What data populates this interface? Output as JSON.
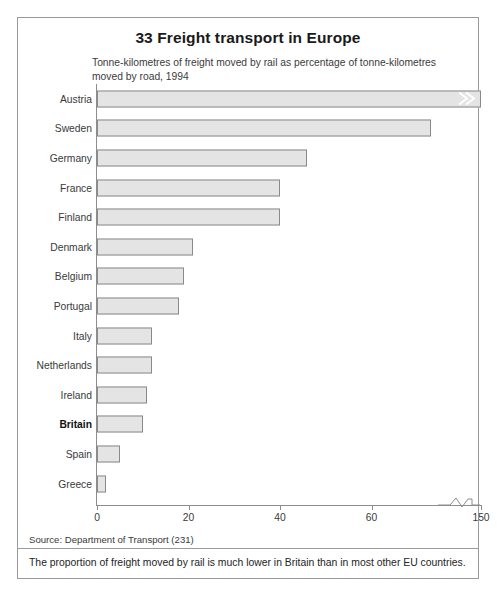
{
  "figure": {
    "title": "33 Freight transport in Europe",
    "subtitle": "Tonne-kilometres of freight moved by rail as percentage of tonne-kilometres moved by road, 1994",
    "source": "Source: Department of Transport (231)",
    "footnote": "The proportion of freight moved by rail is much lower in Britain than in most other EU countries.",
    "break_marker_icon": "double-chevron-break-icon",
    "axis_break_icon": "axis-zigzag-break-icon",
    "colors": {
      "bar_fill": "#e4e4e4",
      "bar_border": "#8a8a8a",
      "axis": "#8d8d8d",
      "frame": "#9a9a9a",
      "text": "#3a3a3a",
      "highlight_text": "#111111"
    }
  },
  "chart_data": {
    "type": "bar",
    "orientation": "horizontal",
    "title": "33 Freight transport in Europe",
    "subtitle": "Tonne-kilometres of freight moved by rail as percentage of tonne-kilometres moved by road, 1994",
    "xlabel": "",
    "ylabel": "",
    "xlim": [
      0,
      150
    ],
    "grid": false,
    "axis_broken": true,
    "axis_break_between": [
      70,
      150
    ],
    "tick_values": [
      0,
      20,
      40,
      60,
      150
    ],
    "tick_labels": [
      "0",
      "20",
      "40",
      "60",
      "150"
    ],
    "highlight_category": "Britain",
    "categories": [
      "Austria",
      "Sweden",
      "Germany",
      "France",
      "Finland",
      "Denmark",
      "Belgium",
      "Portugal",
      "Italy",
      "Netherlands",
      "Ireland",
      "Britain",
      "Spain",
      "Greece"
    ],
    "values": [
      150,
      73,
      46,
      40,
      40,
      21,
      19,
      18,
      12,
      12,
      11,
      10,
      5,
      2
    ],
    "bars": [
      {
        "category": "Austria",
        "value": 150,
        "bold": false,
        "broken": true
      },
      {
        "category": "Sweden",
        "value": 73,
        "bold": false,
        "broken": false
      },
      {
        "category": "Germany",
        "value": 46,
        "bold": false,
        "broken": false
      },
      {
        "category": "France",
        "value": 40,
        "bold": false,
        "broken": false
      },
      {
        "category": "Finland",
        "value": 40,
        "bold": false,
        "broken": false
      },
      {
        "category": "Denmark",
        "value": 21,
        "bold": false,
        "broken": false
      },
      {
        "category": "Belgium",
        "value": 19,
        "bold": false,
        "broken": false
      },
      {
        "category": "Portugal",
        "value": 18,
        "bold": false,
        "broken": false
      },
      {
        "category": "Italy",
        "value": 12,
        "bold": false,
        "broken": false
      },
      {
        "category": "Netherlands",
        "value": 12,
        "bold": false,
        "broken": false
      },
      {
        "category": "Ireland",
        "value": 11,
        "bold": false,
        "broken": false
      },
      {
        "category": "Britain",
        "value": 10,
        "bold": true,
        "broken": false
      },
      {
        "category": "Spain",
        "value": 5,
        "bold": false,
        "broken": false
      },
      {
        "category": "Greece",
        "value": 2,
        "bold": false,
        "broken": false
      }
    ]
  }
}
